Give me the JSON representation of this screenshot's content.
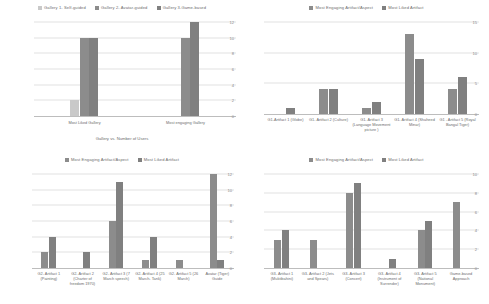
{
  "colors": {
    "series_light": "#c9c9c9",
    "series_mid": "#8c8c8c",
    "series_dark": "#808080",
    "grid": "#e2e2e2",
    "axis": "#bdbdbd",
    "text": "#6d6d6d",
    "tick_text": "#8a8a8a",
    "background": "#ffffff"
  },
  "charts": [
    {
      "id": "chart-gallery-users",
      "type": "bar",
      "title": "",
      "xlabel": "Gallery vs. Number of Users",
      "ylabel": "",
      "ylim": [
        0,
        12
      ],
      "yticks": [
        "12",
        "10",
        "8",
        "6",
        "4",
        "2",
        "0"
      ],
      "ytick_values": [
        12,
        10,
        8,
        6,
        4,
        2,
        0
      ],
      "grid": true,
      "legend_position": "top",
      "categories": [
        "Most Liked Gallery",
        "Most engaging Gallery"
      ],
      "series": [
        {
          "name": "Gallery 1- Self-guided",
          "values": [
            2,
            0
          ],
          "color": "#c9c9c9"
        },
        {
          "name": "Gallery 2- Avatar-guided",
          "values": [
            10,
            10
          ],
          "color": "#8c8c8c"
        },
        {
          "name": "Gallery 3-Game-based",
          "values": [
            10,
            12
          ],
          "color": "#808080"
        }
      ]
    },
    {
      "id": "chart-gallery1-artifacts",
      "type": "bar",
      "title": "",
      "xlabel": "",
      "ylabel": "",
      "ylim": [
        0,
        15
      ],
      "yticks": [
        "15",
        "10",
        "5",
        "0"
      ],
      "ytick_values": [
        15,
        10,
        5,
        0
      ],
      "grid": true,
      "legend_position": "top",
      "categories": [
        "G1-Artifact 1 (Globe)",
        "G1- Artifact 2 (Culture)",
        "G1- Artifact 3 (Language Movement picture )",
        "G1- Artifact 4 (Shaheed Minar)",
        "G1 - Artifact 5 (Royal Bangal Tiger)"
      ],
      "series": [
        {
          "name": "Most Engaging Artifact/Aspect",
          "values": [
            0,
            4,
            1,
            13,
            4
          ],
          "color": "#8c8c8c"
        },
        {
          "name": "Most Liked Artifact",
          "values": [
            1,
            4,
            2,
            9,
            6
          ],
          "color": "#808080"
        }
      ]
    },
    {
      "id": "chart-gallery2-artifacts",
      "type": "bar",
      "title": "",
      "xlabel": "",
      "ylabel": "",
      "ylim": [
        0,
        12
      ],
      "yticks": [
        "12",
        "10",
        "8",
        "6",
        "4",
        "2",
        "0"
      ],
      "ytick_values": [
        12,
        10,
        8,
        6,
        4,
        2,
        0
      ],
      "grid": true,
      "legend_position": "top",
      "categories": [
        "G2- Artifact 1 (Painting)",
        "G2- Artifact 2 (Charter of freedom 1970)",
        "G2- Artifact 3 (7 March speech)",
        "G2- Artifact 4 (25 March- Tank)",
        "G2- Artifact 5 (26 March)",
        "Avatar (Tiger) Guide"
      ],
      "series": [
        {
          "name": "Most Engaging Artifact/Aspect",
          "values": [
            2,
            0,
            6,
            1,
            1,
            12
          ],
          "color": "#8c8c8c"
        },
        {
          "name": "Most Liked Artifact",
          "values": [
            4,
            2,
            11,
            4,
            0,
            1
          ],
          "color": "#808080"
        }
      ]
    },
    {
      "id": "chart-gallery3-artifacts",
      "type": "bar",
      "title": "",
      "xlabel": "",
      "ylabel": "",
      "ylim": [
        0,
        10
      ],
      "yticks": [
        "10",
        "8",
        "6",
        "4",
        "2",
        "0"
      ],
      "ytick_values": [
        10,
        8,
        6,
        4,
        2,
        0
      ],
      "grid": true,
      "legend_position": "top",
      "categories": [
        "G3- Artifact 1 (Muktibahini)",
        "G3- Artifact 2 (Jets and Spears)",
        "G3- Artifact 3 (Concert)",
        "G3- Artifact 4 (Instrument of Surrender)",
        "G3- Artifact 5 (National Monument)",
        "Game-based Approach"
      ],
      "series": [
        {
          "name": "Most Engaging Artifact/Aspect",
          "values": [
            3,
            3,
            8,
            0,
            4,
            7
          ],
          "color": "#8c8c8c"
        },
        {
          "name": "Most Liked Artifact",
          "values": [
            4,
            0,
            9,
            1,
            5,
            0
          ],
          "color": "#808080"
        }
      ]
    }
  ]
}
